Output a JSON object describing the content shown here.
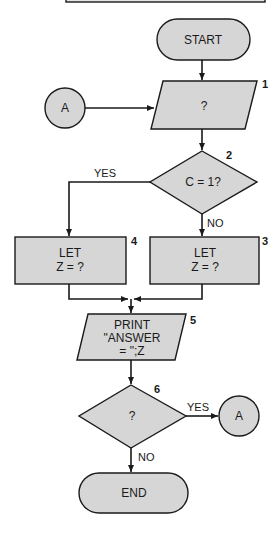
{
  "colors": {
    "fill": "#d6d6d6",
    "stroke": "#1a1a1a",
    "background": "#ffffff"
  },
  "nodes": {
    "start": {
      "type": "terminal",
      "label": "START"
    },
    "step1": {
      "type": "input-output",
      "number": "1",
      "label": "?"
    },
    "connector_in": {
      "type": "connector",
      "label": "A"
    },
    "step2": {
      "type": "decision",
      "number": "2",
      "label": "C = 1?"
    },
    "step3": {
      "type": "process",
      "number": "3",
      "line1": "LET",
      "line2": "Z = ?"
    },
    "step4": {
      "type": "process",
      "number": "4",
      "line1": "LET",
      "line2": "Z = ?"
    },
    "step5": {
      "type": "input-output",
      "number": "5",
      "line1": "PRINT",
      "line2": "\"ANSWER",
      "line3": "= \";Z"
    },
    "step6": {
      "type": "decision",
      "number": "6",
      "label": "?"
    },
    "connector_out": {
      "type": "connector",
      "label": "A"
    },
    "end": {
      "type": "terminal",
      "label": "END"
    }
  },
  "edges": {
    "step2_yes": "YES",
    "step2_no": "NO",
    "step6_yes": "YES",
    "step6_no": "NO"
  }
}
